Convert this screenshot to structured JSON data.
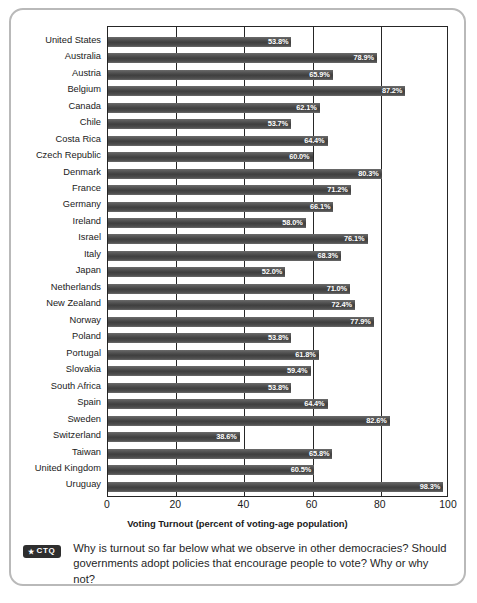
{
  "chart_data": {
    "type": "bar",
    "orientation": "horizontal",
    "title": "",
    "xlabel": "Voting Turnout (percent of voting-age population)",
    "ylabel": "",
    "xlim": [
      0,
      100
    ],
    "xticks": [
      0,
      20,
      40,
      60,
      80,
      100
    ],
    "xtick_labels": [
      "0",
      "20",
      "40",
      "60",
      "80",
      "100"
    ],
    "grid": true,
    "grid_axis": "x",
    "legend": false,
    "value_label_suffix": "%",
    "bar_color": "#4a4a4a",
    "value_label_color": "#ffffff",
    "categories": [
      "United States",
      "Australia",
      "Austria",
      "Belgium",
      "Canada",
      "Chile",
      "Costa Rica",
      "Czech Republic",
      "Denmark",
      "France",
      "Germany",
      "Ireland",
      "Israel",
      "Italy",
      "Japan",
      "Netherlands",
      "New Zealand",
      "Norway",
      "Poland",
      "Portugal",
      "Slovakia",
      "South Africa",
      "Spain",
      "Sweden",
      "Switzerland",
      "Taiwan",
      "United Kingdom",
      "Uruguay"
    ],
    "values": [
      53.8,
      78.9,
      65.9,
      87.2,
      62.1,
      53.7,
      64.4,
      60.0,
      80.3,
      71.2,
      66.1,
      58.0,
      76.1,
      68.3,
      52.0,
      71.0,
      72.4,
      77.9,
      53.8,
      61.8,
      59.4,
      53.8,
      64.4,
      82.6,
      38.6,
      65.8,
      60.5,
      98.3
    ],
    "value_labels": [
      "53.8%",
      "78.9%",
      "65.9%",
      "87.2%",
      "62.1%",
      "53.7%",
      "64.4%",
      "60.0%",
      "80.3%",
      "71.2%",
      "66.1%",
      "58.0%",
      "76.1%",
      "68.3%",
      "52.0%",
      "71.0%",
      "72.4%",
      "77.9%",
      "53.8%",
      "61.8%",
      "59.4%",
      "53.8%",
      "64.4%",
      "82.6%",
      "38.6%",
      "65.8%",
      "60.5%",
      "98.3%"
    ]
  },
  "ctq": {
    "badge_star": "★",
    "badge_label": "CTQ",
    "text": "Why is turnout so far below what we observe in other democracies? Should governments adopt policies that encourage people to vote? Why or why not?"
  }
}
